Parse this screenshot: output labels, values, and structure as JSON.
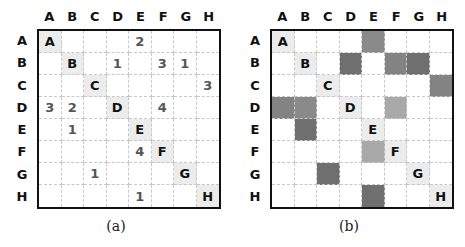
{
  "labels": [
    "A",
    "B",
    "C",
    "D",
    "E",
    "F",
    "G",
    "H"
  ],
  "panel_a": {
    "caption": "(a)",
    "matrix": [
      [
        "A",
        "",
        "",
        "",
        "2",
        "",
        "",
        ""
      ],
      [
        "",
        "B",
        "",
        "1",
        "",
        "3",
        "1",
        ""
      ],
      [
        "",
        "",
        "C",
        "",
        "",
        "",
        "",
        "3"
      ],
      [
        "3",
        "2",
        "",
        "D",
        "",
        "4",
        "",
        ""
      ],
      [
        "",
        "1",
        "",
        "",
        "E",
        "",
        "",
        ""
      ],
      [
        "",
        "",
        "",
        "",
        "4",
        "F",
        "",
        ""
      ],
      [
        "",
        "",
        "1",
        "",
        "",
        "",
        "G",
        ""
      ],
      [
        "",
        "",
        "",
        "",
        "1",
        "",
        "",
        "H"
      ]
    ]
  },
  "panel_b": {
    "caption": "(b)",
    "matrix": [
      [
        "A",
        "",
        "",
        "",
        "2",
        "",
        "",
        ""
      ],
      [
        "",
        "B",
        "",
        "1",
        "",
        "3",
        "1",
        ""
      ],
      [
        "",
        "",
        "C",
        "",
        "",
        "",
        "",
        "3"
      ],
      [
        "3",
        "2",
        "",
        "D",
        "",
        "4",
        "",
        ""
      ],
      [
        "",
        "1",
        "",
        "",
        "E",
        "",
        "",
        ""
      ],
      [
        "",
        "",
        "",
        "",
        "4",
        "F",
        "",
        ""
      ],
      [
        "",
        "",
        "1",
        "",
        "",
        "",
        "G",
        ""
      ],
      [
        "",
        "",
        "",
        "",
        "1",
        "",
        "",
        "H"
      ]
    ],
    "shade_colors": {
      "1": "#6f6f6f",
      "2": "#8a8a8a",
      "3": "#838383",
      "4": "#a9a9a9"
    }
  },
  "colors": {
    "diagonal": "#ececec",
    "border": "#111111",
    "dashed_grid": "#c8c8c8"
  }
}
